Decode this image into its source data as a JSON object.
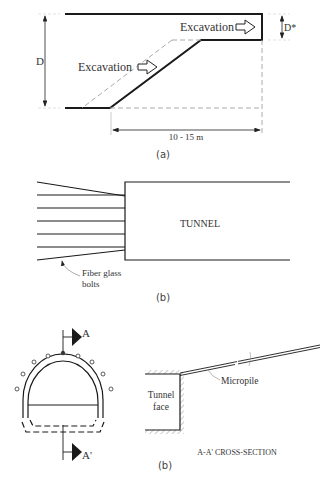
{
  "figure": {
    "panel_a": {
      "label": "(a)",
      "excavation_upper": "Excavation",
      "excavation_lower": "Excavation",
      "dim_height": "D",
      "dim_step": "D*",
      "dim_length": "10 - 15 m"
    },
    "panel_b": {
      "label": "(b)",
      "tunnel_label": "TUNNEL",
      "bolts_label_line1": "Fiber glass",
      "bolts_label_line2": "bolts"
    },
    "panel_c": {
      "label": "(b)",
      "section_top": "A",
      "section_bottom": "A'",
      "face_line1": "Tunnel",
      "face_line2": "face",
      "micropile_label": "Micropile",
      "section_title": "A-A' CROSS-SECTION"
    },
    "colors": {
      "line": "#1a1a1a",
      "dashed": "#aaaaaa",
      "text": "#333333"
    }
  }
}
